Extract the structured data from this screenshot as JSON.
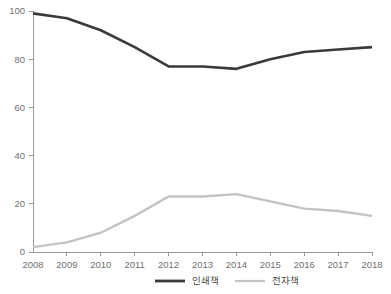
{
  "chart_data": {
    "type": "line",
    "title": "",
    "subtitle": "",
    "xlabel": "",
    "ylabel": "",
    "categories": [
      "2008",
      "2009",
      "2010",
      "2011",
      "2012",
      "2013",
      "2014",
      "2015",
      "2016",
      "2017",
      "2018"
    ],
    "x": [
      2008,
      2009,
      2010,
      2011,
      2012,
      2013,
      2014,
      2015,
      2016,
      2017,
      2018
    ],
    "series": [
      {
        "name": "인쇄책",
        "color": "#3a3a3a",
        "values": [
          99,
          97,
          92,
          85,
          77,
          77,
          76,
          80,
          83,
          84,
          85
        ]
      },
      {
        "name": "전자책",
        "color": "#c3c3c3",
        "values": [
          2,
          4,
          8,
          15,
          23,
          23,
          24,
          21,
          18,
          17,
          15
        ]
      }
    ],
    "ylim": [
      0,
      100
    ],
    "yticks": [
      0,
      20,
      40,
      60,
      80,
      100
    ],
    "ytick_labels": [
      "0",
      "20",
      "40",
      "60",
      "80",
      "100"
    ],
    "xtick_labels": [
      "2008",
      "2009",
      "2010",
      "2011",
      "2012",
      "2013",
      "2014",
      "2015",
      "2016",
      "2017",
      "2018"
    ],
    "grid": false,
    "legend_position": "bottom",
    "legend": [
      {
        "label": "인쇄책",
        "color": "#3a3a3a"
      },
      {
        "label": "전자책",
        "color": "#c3c3c3"
      }
    ]
  },
  "axes": {
    "y_ticks": [
      "0",
      "20",
      "40",
      "60",
      "80",
      "100"
    ],
    "x_ticks": [
      "2008",
      "2009",
      "2010",
      "2011",
      "2012",
      "2013",
      "2014",
      "2015",
      "2016",
      "2017",
      "2018"
    ]
  },
  "legend": {
    "items": [
      {
        "label": "인쇄책"
      },
      {
        "label": "전자책"
      }
    ]
  },
  "colors": {
    "print_series": "#3a3a3a",
    "ebook_series": "#c3c3c3",
    "axis": "#9a9a9a",
    "tick_text": "#6f6f6f",
    "legend_text": "#4a4a4a",
    "background": "#ffffff"
  }
}
